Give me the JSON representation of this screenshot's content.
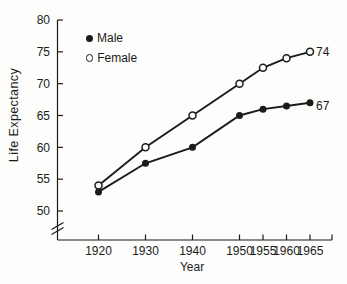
{
  "figure": {
    "background": "#fdfdfb",
    "ink": "#1b1b1b"
  },
  "chart_data": {
    "type": "line",
    "title": "",
    "xlabel": "Year",
    "ylabel": "Life Expectancy",
    "x": [
      1920,
      1930,
      1940,
      1950,
      1955,
      1960,
      1965
    ],
    "x_tick_labels": [
      "1920",
      "1930",
      "1940",
      "1950",
      "1955",
      "1960",
      "1965"
    ],
    "y_ticks": [
      50,
      55,
      60,
      65,
      70,
      75,
      80
    ],
    "ylim": [
      50,
      80
    ],
    "y_axis_break": true,
    "grid": false,
    "legend_position": "top-left",
    "series": [
      {
        "name": "Male",
        "marker": "filled-circle",
        "values": [
          53,
          57.5,
          60,
          65,
          66,
          66.5,
          67
        ],
        "end_label": "67"
      },
      {
        "name": "Female",
        "marker": "open-circle",
        "values": [
          54,
          60,
          65,
          70,
          72.5,
          74,
          75
        ],
        "end_label": "74"
      }
    ]
  }
}
